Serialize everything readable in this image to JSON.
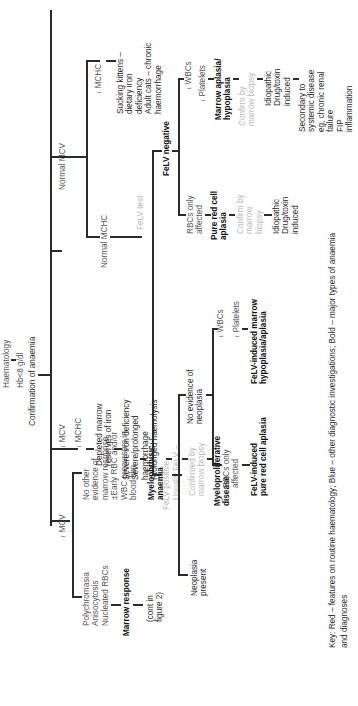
{
  "diagram": {
    "root": {
      "haematology": "Haematology",
      "hb": "Hb<8 g/dl",
      "confirmation": "Confirmation of anaemia"
    },
    "increased_mcv": {
      "label": "MCV",
      "arrow": "up",
      "left": {
        "features": "Polychromasia\nAnisocytosis\nNucleated RBCs",
        "outcome": "Marrow response",
        "continuation": "(cont in\nfigure 2)"
      },
      "right": {
        "features": "No other\nevidence of\nmarrow response\n±Early RBC and/or\nWBC precursors in\nblood film",
        "diagnosis1": "Myelophthisic\nanaemia",
        "test1": "Usually FeLV –",
        "test2": "Confirmed by\nmarrow biopsy",
        "diagnosis2": "Myeloproliferative\ndisease"
      }
    },
    "decreased_mcv_mchc": {
      "mcv": "MCV",
      "mchc": "MCHC",
      "arrow": "down",
      "cause": "Depleted marrow\nreserves of iron",
      "conditions": "Severe iron deficiency\nSevere/prolonged\nhaemorrhage\nProlonged haemolysis"
    },
    "normal_mcv": {
      "label": "Normal MCV",
      "decreased_mchc": {
        "label": "MCHC",
        "arrow": "down",
        "causes": "Sucking kittens –\ndietary iron\ndeficiency\nAdult cats – chronic\nhaemorrhage"
      },
      "normal_mchc": {
        "label": "Normal MCHC",
        "test": "FeLV test",
        "felv_positive": {
          "label": "FeLV positive",
          "neoplasia_present": "Neoplasia\npresent",
          "no_neoplasia": "No evidence of\nneoplasia",
          "rbcs_only": "RBCs only\naffected",
          "rbcs_only_dx": "FeLV-induced\npure red cell aplasia",
          "wbcs": "WBCs",
          "platelets": "Platelets",
          "marrow_dx": "FeLV-induced marrow\nhypoplasia/aplasia"
        },
        "felv_negative": {
          "label": "FeLV negative",
          "rbcs_only": "RBCs only\naffected",
          "rbcs_only_dx": "Pure red cell\naplasia",
          "rbcs_only_confirm": "Confirm by\nmarrow\nbiopsy",
          "rbcs_only_causes": "Idiopathic\nDrug/toxin\ninduced",
          "wbcs": "WBCs",
          "platelets": "Platelets",
          "marrow_dx": "Marrow aplasia/\nhypoplasia",
          "marrow_confirm": "Confirm by\nmarrow biopsy",
          "marrow_causes": "Idiopathic\nDrug/toxin\ninduced",
          "secondary": "Secondary to\nsystemic disease\neg, chronic renal\nfailure\nFIP\ninflammation"
        }
      }
    },
    "key": {
      "line1": "Key: Red – features on routine haematology; Blue – other diagnostic investigations; Bold – major types of anaemia",
      "line2": "and diagnoses"
    },
    "arrow_up": "↑",
    "arrow_down": "↓"
  }
}
